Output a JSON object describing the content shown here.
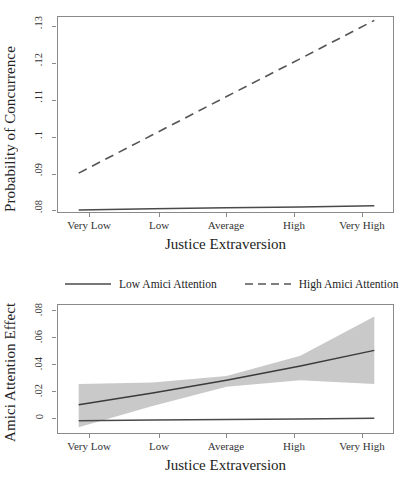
{
  "figure": {
    "legend": {
      "items": [
        {
          "label": "Low Amici Attention",
          "style": "solid",
          "color": "#4a4a4a"
        },
        {
          "label": "High Amici Attention",
          "style": "dashed",
          "color": "#555555"
        }
      ]
    }
  },
  "chart_data": [
    {
      "id": "probability-of-concurrence",
      "type": "line",
      "title": "",
      "xlabel": "Justice Extraversion",
      "ylabel": "Probability of Concurrence",
      "categories": [
        "Very Low",
        "Low",
        "Average",
        "High",
        "Very High"
      ],
      "x": [
        1,
        2,
        3,
        4,
        5
      ],
      "xlim": [
        0.72,
        5.28
      ],
      "ylim": [
        0.0795,
        0.1325
      ],
      "yticks": [
        0.08,
        0.09,
        0.1,
        0.11,
        0.12,
        0.13
      ],
      "ytick_labels": [
        ".08",
        ".09",
        ".1",
        ".11",
        ".12",
        ".13"
      ],
      "grid": false,
      "legend_position": "below-plot",
      "series": [
        {
          "name": "Low Amici Attention",
          "style": "solid",
          "color": "#4a4a4a",
          "values": [
            0.0806,
            0.0809,
            0.0812,
            0.0814,
            0.0817
          ]
        },
        {
          "name": "High Amici Attention",
          "style": "dashed",
          "color": "#555555",
          "values": [
            0.0905,
            0.1008,
            0.1111,
            0.1213,
            0.1316
          ]
        }
      ]
    },
    {
      "id": "amici-attention-effect",
      "type": "line",
      "title": "",
      "xlabel": "Justice Extraversion",
      "ylabel": "Amici Attention Effect",
      "categories": [
        "Very Low",
        "Low",
        "Average",
        "High",
        "Very High"
      ],
      "x": [
        1,
        2,
        3,
        4,
        5
      ],
      "xlim": [
        0.72,
        5.28
      ],
      "ylim": [
        -0.0105,
        0.0855
      ],
      "yticks": [
        0,
        0.02,
        0.04,
        0.06,
        0.08
      ],
      "ytick_labels": [
        "0",
        ".02",
        ".04",
        ".06",
        ".08"
      ],
      "grid": false,
      "legend_position": "above-plot",
      "series": [
        {
          "name": "Amici Attention Effect",
          "style": "solid",
          "color": "#3b3b3b",
          "values": [
            0.0118,
            0.0205,
            0.03,
            0.0405,
            0.052
          ]
        },
        {
          "name": "Zero Reference Line",
          "style": "solid",
          "color": "#4a4a4a",
          "values": [
            0.0,
            0.0005,
            0.001,
            0.0014,
            0.0018
          ]
        }
      ],
      "confidence_band": {
        "name": "95% Confidence Interval",
        "fill": "#c9c9c9",
        "upper": [
          0.0272,
          0.0283,
          0.033,
          0.048,
          0.077
        ],
        "lower": [
          -0.0048,
          0.011,
          0.0252,
          0.03,
          0.0272
        ]
      }
    }
  ]
}
